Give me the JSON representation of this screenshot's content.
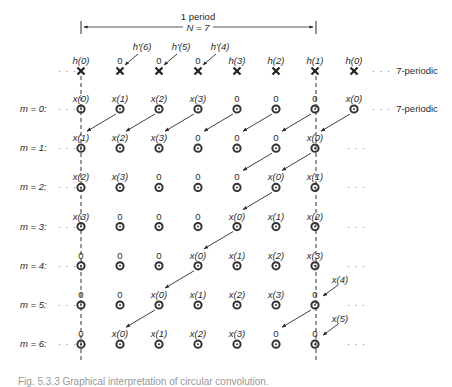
{
  "header": {
    "period_label": "1 period",
    "n_label": "N = 7"
  },
  "columns_x": [
    81,
    120,
    159,
    198,
    237,
    276,
    315,
    354
  ],
  "h_row": {
    "y": 71,
    "labels": [
      "h(0)",
      "0",
      "0",
      "0",
      "h(3)",
      "h(2)",
      "h(1)",
      "h(0)"
    ],
    "prime_labels": [
      {
        "text": "h'(6)",
        "col": 1
      },
      {
        "text": "h'(5)",
        "col": 2
      },
      {
        "text": "h'(4)",
        "col": 3
      }
    ],
    "suffix": "7-periodic"
  },
  "rows": [
    {
      "label": "m = 0:",
      "values": [
        "x(0)",
        "x(1)",
        "x(2)",
        "x(3)",
        "0",
        "0",
        "0",
        "x(0)"
      ],
      "suffix": "7-periodic"
    },
    {
      "label": "m = 1:",
      "values": [
        "x(1)",
        "x(2)",
        "x(3)",
        "0",
        "0",
        "0",
        "x(0)"
      ],
      "suffix": "..."
    },
    {
      "label": "m = 2:",
      "values": [
        "x(2)",
        "x(3)",
        "0",
        "0",
        "0",
        "x(0)",
        "x(1)"
      ],
      "suffix": "..."
    },
    {
      "label": "m = 3:",
      "values": [
        "x(3)",
        "0",
        "0",
        "0",
        "x(0)",
        "x(1)",
        "x(2)"
      ],
      "suffix": "..."
    },
    {
      "label": "m = 4:",
      "values": [
        "0",
        "0",
        "0",
        "x(0)",
        "x(1)",
        "x(2)",
        "x(3)"
      ],
      "suffix": "..."
    },
    {
      "label": "m = 5:",
      "values": [
        "0",
        "0",
        "x(0)",
        "x(1)",
        "x(2)",
        "x(3)",
        "0"
      ],
      "suffix": "..."
    },
    {
      "label": "m = 6:",
      "values": [
        "0",
        "x(0)",
        "x(1)",
        "x(2)",
        "x(3)",
        "0",
        "0"
      ],
      "suffix": "..."
    }
  ],
  "side_labels": [
    {
      "text": "x(4)",
      "row": 5
    },
    {
      "text": "x(5)",
      "row": 6
    }
  ],
  "caption": "Fig. 5.3.3  Graphical interpretation of circular convolution."
}
